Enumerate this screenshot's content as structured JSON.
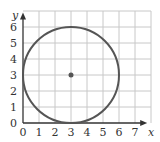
{
  "chart_data": {
    "type": "scatter",
    "title": "",
    "xlabel": "x",
    "ylabel": "y",
    "xlim": [
      0,
      7
    ],
    "ylim": [
      0,
      6
    ],
    "grid": true,
    "x_ticks": [
      "0",
      "1",
      "2",
      "3",
      "4",
      "5",
      "6",
      "7"
    ],
    "y_ticks": [
      "0",
      "1",
      "2",
      "3",
      "4",
      "5",
      "6"
    ],
    "shapes": [
      {
        "type": "circle",
        "center": [
          3,
          3
        ],
        "radius": 3
      }
    ],
    "points": [
      {
        "x": 3,
        "y": 3,
        "label": "center"
      }
    ]
  },
  "colors": {
    "grid": "#c8c8c8",
    "axis": "#333333",
    "curve": "#555555",
    "point": "#555555"
  }
}
